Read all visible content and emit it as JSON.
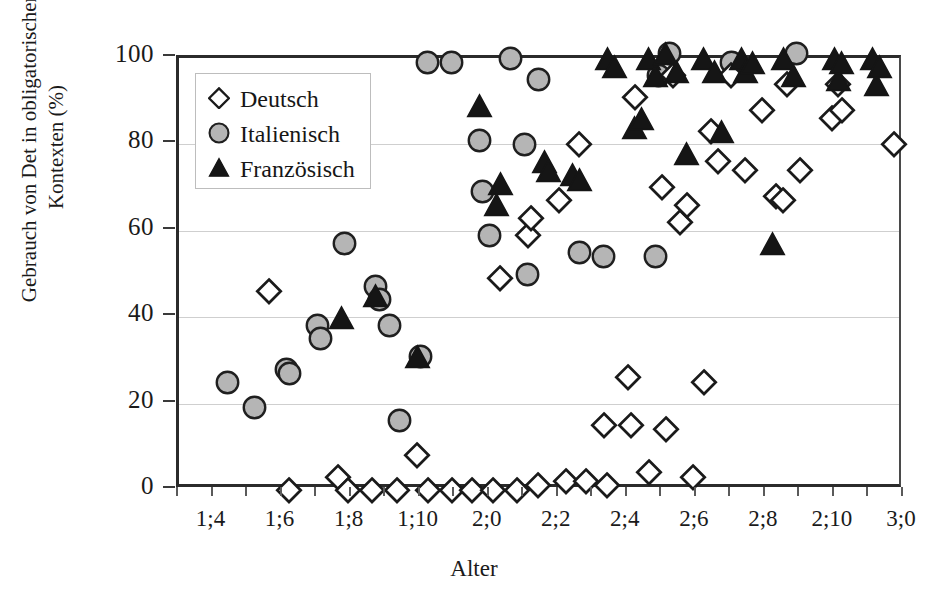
{
  "chart_data": {
    "type": "scatter",
    "title": "",
    "xlabel": "Alter",
    "ylabel": "Gebrauch von Det in obligatorischen Kontexten (%)",
    "xlim": [
      15,
      36
    ],
    "ylim": [
      0,
      100
    ],
    "grid": true,
    "grid_axis": "y",
    "legend_position": "upper-left-inside",
    "x_tick_labels": [
      "1;4",
      "1;6",
      "1;8",
      "1;10",
      "2;0",
      "2;2",
      "2;4",
      "2;6",
      "2;8",
      "2;10",
      "3;0"
    ],
    "x_tick_values": [
      16,
      18,
      20,
      22,
      24,
      26,
      28,
      30,
      32,
      34,
      36
    ],
    "x_minor_tick_values": [
      15,
      16,
      17,
      18,
      19,
      20,
      21,
      22,
      23,
      24,
      25,
      26,
      27,
      28,
      29,
      30,
      31,
      32,
      33,
      34,
      35,
      36
    ],
    "y_tick_labels": [
      "0",
      "20",
      "40",
      "60",
      "80",
      "100"
    ],
    "y_tick_values": [
      0,
      20,
      40,
      60,
      80,
      100
    ],
    "series": [
      {
        "name": "Deutsch",
        "marker": "diamond",
        "fill": "#ffffff",
        "stroke": "#1a1a1a",
        "points": [
          [
            17.6,
            46
          ],
          [
            18.2,
            0
          ],
          [
            19.6,
            3
          ],
          [
            19.9,
            0
          ],
          [
            20.6,
            0
          ],
          [
            21.3,
            0
          ],
          [
            21.9,
            8
          ],
          [
            22.2,
            0
          ],
          [
            22.9,
            0
          ],
          [
            23.5,
            0
          ],
          [
            24.1,
            0
          ],
          [
            24.3,
            49
          ],
          [
            24.8,
            0
          ],
          [
            25.1,
            59
          ],
          [
            25.2,
            63
          ],
          [
            25.4,
            1
          ],
          [
            26.0,
            67
          ],
          [
            26.2,
            2
          ],
          [
            26.6,
            80
          ],
          [
            26.8,
            2
          ],
          [
            27.3,
            15
          ],
          [
            27.4,
            1
          ],
          [
            28.0,
            26
          ],
          [
            28.1,
            15
          ],
          [
            28.2,
            91
          ],
          [
            28.6,
            4
          ],
          [
            29.0,
            70
          ],
          [
            29.1,
            14
          ],
          [
            29.3,
            96
          ],
          [
            29.5,
            62
          ],
          [
            29.7,
            66
          ],
          [
            29.9,
            3
          ],
          [
            30.2,
            25
          ],
          [
            30.4,
            83
          ],
          [
            30.6,
            76
          ],
          [
            31.0,
            96
          ],
          [
            31.4,
            74
          ],
          [
            31.9,
            88
          ],
          [
            32.3,
            68
          ],
          [
            32.5,
            67
          ],
          [
            32.6,
            94
          ],
          [
            33.0,
            74
          ],
          [
            33.9,
            86
          ],
          [
            34.1,
            94
          ],
          [
            34.2,
            88
          ],
          [
            35.7,
            80
          ]
        ]
      },
      {
        "name": "Italienisch",
        "marker": "circle",
        "fill": "#b5b5b5",
        "stroke": "#1f1f1f",
        "points": [
          [
            16.4,
            25
          ],
          [
            17.2,
            19
          ],
          [
            18.1,
            28
          ],
          [
            18.2,
            27
          ],
          [
            19.0,
            38
          ],
          [
            19.1,
            35
          ],
          [
            19.8,
            57
          ],
          [
            20.7,
            47
          ],
          [
            20.8,
            44
          ],
          [
            21.1,
            38
          ],
          [
            21.4,
            16
          ],
          [
            22.0,
            31
          ],
          [
            22.2,
            99
          ],
          [
            22.9,
            99
          ],
          [
            23.7,
            81
          ],
          [
            23.8,
            69
          ],
          [
            24.0,
            59
          ],
          [
            24.6,
            100
          ],
          [
            25.0,
            80
          ],
          [
            25.1,
            50
          ],
          [
            25.4,
            95
          ],
          [
            26.6,
            55
          ],
          [
            27.3,
            54
          ],
          [
            28.8,
            54
          ],
          [
            28.9,
            96
          ],
          [
            29.2,
            101
          ],
          [
            31.0,
            99
          ],
          [
            32.9,
            101
          ]
        ]
      },
      {
        "name": "Französisch",
        "marker": "triangle",
        "fill": "#151515",
        "stroke": "#151515",
        "points": [
          [
            19.7,
            40
          ],
          [
            20.7,
            45
          ],
          [
            21.9,
            31
          ],
          [
            23.7,
            89
          ],
          [
            24.2,
            66
          ],
          [
            24.3,
            71
          ],
          [
            25.6,
            76
          ],
          [
            25.7,
            74
          ],
          [
            26.4,
            73
          ],
          [
            26.6,
            72
          ],
          [
            27.4,
            100
          ],
          [
            27.6,
            98
          ],
          [
            28.2,
            84
          ],
          [
            28.4,
            86
          ],
          [
            28.6,
            100
          ],
          [
            28.8,
            96
          ],
          [
            29.1,
            101
          ],
          [
            29.4,
            97
          ],
          [
            29.7,
            78
          ],
          [
            30.2,
            100
          ],
          [
            30.5,
            97
          ],
          [
            30.7,
            83
          ],
          [
            31.3,
            100
          ],
          [
            31.4,
            97
          ],
          [
            31.6,
            99
          ],
          [
            32.2,
            57
          ],
          [
            32.5,
            100
          ],
          [
            32.8,
            96
          ],
          [
            34.0,
            100
          ],
          [
            34.1,
            95
          ],
          [
            34.2,
            99
          ],
          [
            35.1,
            100
          ],
          [
            35.2,
            94
          ],
          [
            35.3,
            98
          ]
        ]
      }
    ]
  },
  "legend": {
    "items": [
      {
        "label": "Deutsch",
        "marker": "diamond"
      },
      {
        "label": "Italienisch",
        "marker": "circle"
      },
      {
        "label": "Französisch",
        "marker": "triangle"
      }
    ]
  },
  "axes": {
    "x_title": "Alter",
    "y_title_line1": "Gebrauch von Det in obligatorischen",
    "y_title_line2": "Kontexten (%)"
  },
  "colors": {
    "axis": "#2b2b2b",
    "grid": "#cfcfcf",
    "italian_fill": "#b5b5b5",
    "french_fill": "#151515",
    "german_fill": "#ffffff",
    "text": "#1a1a1a"
  }
}
